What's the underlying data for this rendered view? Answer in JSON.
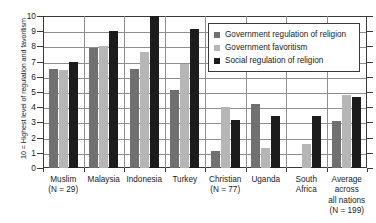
{
  "chart_data": {
    "type": "bar",
    "title": "",
    "xlabel": "",
    "ylabel": "10 = Highest level of regulation and favoritism",
    "ylim": [
      0,
      10
    ],
    "yticks": [
      0,
      1,
      2,
      3,
      4,
      5,
      6,
      7,
      8,
      9,
      10
    ],
    "ytick_labels": [
      "0",
      "1",
      "2",
      "3",
      "4",
      "5",
      "6",
      "7",
      "8",
      "9",
      "10"
    ],
    "grid": true,
    "legend_position": "upper right",
    "categories": [
      "Muslim\n(N = 29)",
      "Malaysia",
      "Indonesia",
      "Turkey",
      "Christian\n(N = 77)",
      "Uganda",
      "South\nAfrica",
      "Average\nacross\nall nations\n(N = 199)"
    ],
    "category_lines": [
      [
        "Muslim",
        "(N = 29)"
      ],
      [
        "Malaysia"
      ],
      [
        "Indonesia"
      ],
      [
        "Turkey"
      ],
      [
        "Christian",
        "(N = 77)"
      ],
      [
        "Uganda"
      ],
      [
        "South",
        "Africa"
      ],
      [
        "Average",
        "across",
        "all nations",
        "(N = 199)"
      ]
    ],
    "series": [
      {
        "name": "Government regulation of religion",
        "color": "#707070",
        "values": [
          6.5,
          7.9,
          6.5,
          5.1,
          1.1,
          4.2,
          0.0,
          3.1
        ]
      },
      {
        "name": "Government favoritism",
        "color": "#b6b6b6",
        "values": [
          6.45,
          8.0,
          7.6,
          6.85,
          4.0,
          1.3,
          1.55,
          4.8
        ]
      },
      {
        "name": "Social regulation of religion",
        "color": "#1c1c1c",
        "values": [
          7.0,
          9.0,
          10.0,
          9.15,
          3.15,
          3.4,
          3.4,
          4.65
        ]
      }
    ]
  },
  "legend": {
    "items": [
      {
        "label": "Government regulation of religion",
        "swatch": "s0"
      },
      {
        "label": "Government favoritism",
        "swatch": "s1"
      },
      {
        "label": "Social regulation of religion",
        "swatch": "s2"
      }
    ]
  }
}
